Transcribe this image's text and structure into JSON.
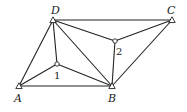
{
  "diagram": {
    "control_points": [
      {
        "id": "A",
        "label": "A",
        "x": 19,
        "y": 86,
        "label_x": 14,
        "label_y": 102,
        "marker": "triangle"
      },
      {
        "id": "B",
        "label": "B",
        "x": 112,
        "y": 86,
        "label_x": 108,
        "label_y": 102,
        "marker": "triangle"
      },
      {
        "id": "C",
        "label": "C",
        "x": 172,
        "y": 20,
        "label_x": 167,
        "label_y": 14,
        "marker": "triangle"
      },
      {
        "id": "D",
        "label": "D",
        "x": 53,
        "y": 20,
        "label_x": 51,
        "label_y": 14,
        "marker": "triangle"
      }
    ],
    "unknown_points": [
      {
        "id": "1",
        "label": "1",
        "x": 57,
        "y": 64,
        "label_x": 54,
        "label_y": 79,
        "marker": "circle"
      },
      {
        "id": "2",
        "label": "2",
        "x": 115,
        "y": 41,
        "label_x": 116,
        "label_y": 55,
        "marker": "circle"
      }
    ],
    "edges": [
      [
        "D",
        "C"
      ],
      [
        "D",
        "A"
      ],
      [
        "D",
        "1"
      ],
      [
        "D",
        "B"
      ],
      [
        "D",
        "2"
      ],
      [
        "A",
        "1"
      ],
      [
        "A",
        "B"
      ],
      [
        "1",
        "B"
      ],
      [
        "2",
        "C"
      ],
      [
        "2",
        "B"
      ],
      [
        "B",
        "C"
      ]
    ],
    "colors": {
      "line": "#222222",
      "background": "#ffffff"
    }
  }
}
